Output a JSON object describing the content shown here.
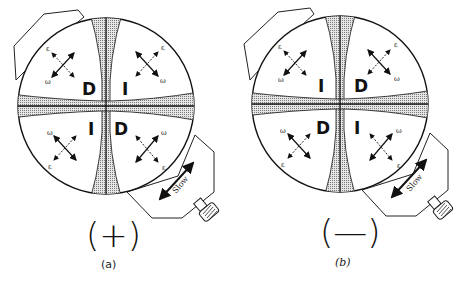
{
  "figure": {
    "panels": [
      {
        "id": "a",
        "caption": "(a)",
        "sign_label": "(+)",
        "quadrant_labels": {
          "top_left": "D",
          "top_right": "I",
          "bottom_left": "I",
          "bottom_right": "D"
        },
        "arrow_labels": {
          "epsilon": "ε",
          "omega": "ω"
        },
        "compensator_label": "Slow"
      },
      {
        "id": "b",
        "caption": "(b)",
        "sign_label": "(—)",
        "quadrant_labels": {
          "top_left": "I",
          "top_right": "D",
          "bottom_left": "D",
          "bottom_right": "I"
        },
        "arrow_labels": {
          "epsilon": "ε",
          "omega": "ω"
        },
        "compensator_label": "Slow"
      }
    ],
    "colors": {
      "line": "#111111",
      "isogyre_fill": "#c9c9c9",
      "background": "#ffffff"
    }
  }
}
